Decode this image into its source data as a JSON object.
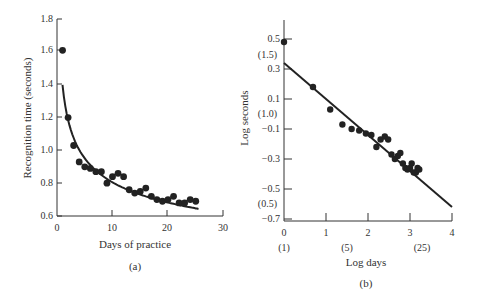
{
  "chart_data": [
    {
      "id": "a",
      "type": "scatter",
      "panel_label": "(a)",
      "title": "",
      "xlabel": "Days of practice",
      "ylabel": "Recognition time (seconds)",
      "xlim": [
        0,
        30
      ],
      "ylim": [
        0.6,
        1.8
      ],
      "x_ticks": [
        0,
        10,
        20,
        30
      ],
      "y_ticks": [
        0.6,
        0.8,
        1.0,
        1.2,
        1.4,
        1.6,
        1.8
      ],
      "x_tick_labels": [
        "0",
        "10",
        "20",
        "30"
      ],
      "y_tick_labels": [
        "0.6",
        "0.8",
        "1.0",
        "1.2",
        "1.4",
        "1.6",
        "1.8"
      ],
      "grid": false,
      "legend": null,
      "series": [
        {
          "name": "Observed",
          "style": "points",
          "x": [
            1,
            2,
            3,
            4,
            5,
            6,
            7,
            8,
            9,
            10,
            11,
            12,
            13,
            14,
            15,
            16,
            17,
            18,
            19,
            20,
            21,
            22,
            23,
            24,
            25
          ],
          "y": [
            1.61,
            1.2,
            1.03,
            0.93,
            0.9,
            0.89,
            0.87,
            0.87,
            0.8,
            0.84,
            0.86,
            0.84,
            0.76,
            0.74,
            0.75,
            0.77,
            0.72,
            0.7,
            0.69,
            0.7,
            0.72,
            0.68,
            0.68,
            0.7,
            0.69
          ]
        },
        {
          "name": "Power-law fit",
          "style": "curve",
          "equation": "T = 1.40 * P^-0.24",
          "x_range": [
            1,
            25.5
          ]
        }
      ]
    },
    {
      "id": "b",
      "type": "scatter",
      "panel_label": "(b)",
      "title": "",
      "xlabel": "Log days",
      "ylabel": "Log seconds",
      "xlim": [
        0,
        4
      ],
      "ylim": [
        -0.7,
        0.5
      ],
      "x_ticks": [
        0,
        1,
        2,
        3,
        4
      ],
      "y_ticks": [
        -0.7,
        -0.5,
        -0.3,
        -0.1,
        0.1,
        0.3,
        0.5
      ],
      "x_tick_labels": [
        "0",
        "1",
        "2",
        "3",
        "4"
      ],
      "y_tick_labels": [
        "-0.7",
        "-0.5",
        "-0.3",
        "-0.1",
        "0.1",
        "0.3",
        "0.5"
      ],
      "x_secondary_labels": [
        {
          "at": 0,
          "label": "(1)"
        },
        {
          "at": 1.61,
          "label": "(5)"
        },
        {
          "at": 3.22,
          "label": "(25)"
        }
      ],
      "y_secondary_labels": [
        {
          "at": 0.405,
          "label": "(1.5)"
        },
        {
          "at": 0.0,
          "label": "(1.0)"
        },
        {
          "at": -0.6,
          "label": "(0.5)"
        }
      ],
      "grid": false,
      "legend": null,
      "series": [
        {
          "name": "Observed (log-log)",
          "style": "points",
          "x": [
            0.0,
            0.69,
            1.1,
            1.39,
            1.61,
            1.79,
            1.95,
            2.08,
            2.2,
            2.3,
            2.4,
            2.48,
            2.56,
            2.64,
            2.71,
            2.77,
            2.83,
            2.89,
            2.94,
            3.0,
            3.04,
            3.09,
            3.14,
            3.18,
            3.22
          ],
          "y": [
            0.48,
            0.18,
            0.03,
            -0.07,
            -0.1,
            -0.11,
            -0.13,
            -0.14,
            -0.22,
            -0.17,
            -0.15,
            -0.17,
            -0.27,
            -0.3,
            -0.28,
            -0.26,
            -0.33,
            -0.36,
            -0.37,
            -0.36,
            -0.33,
            -0.39,
            -0.39,
            -0.36,
            -0.37
          ]
        },
        {
          "name": "Linear fit",
          "style": "line",
          "equation": "log T = 0.34 - 0.24 * log P",
          "x_range": [
            0,
            4
          ],
          "y_at_start": 0.34,
          "y_at_end": -0.62
        }
      ]
    }
  ],
  "panels": {
    "a": {
      "ylabel": "Recognition time (seconds)",
      "xlabel": "Days of practice",
      "label": "(a)",
      "y_ticks": [
        "0.6",
        "0.8",
        "1.0",
        "1.2",
        "1.4",
        "1.6",
        "1.8"
      ],
      "x_ticks": [
        "0",
        "10",
        "20",
        "30"
      ]
    },
    "b": {
      "ylabel": "Log seconds",
      "xlabel": "Log days",
      "label": "(b)",
      "y_ticks": [
        "−0.7",
        "−0.5",
        "−0.3",
        "−0.1",
        "0.1",
        "0.3",
        "0.5"
      ],
      "y_paren": [
        "(1.5)",
        "(1.0)",
        "(0.5)"
      ],
      "x_ticks": [
        "0",
        "1",
        "2",
        "3",
        "4"
      ],
      "x_paren": [
        "(1)",
        "(5)",
        "(25)"
      ]
    }
  }
}
